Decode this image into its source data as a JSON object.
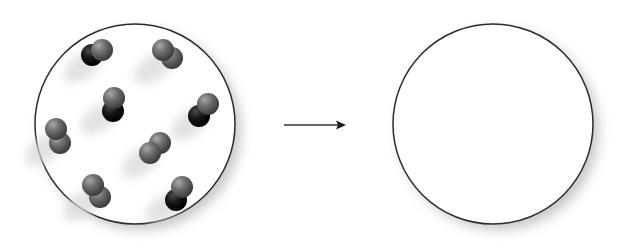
{
  "diagram": {
    "left_container": {
      "label": "container-with-molecules",
      "cx": 135,
      "cy": 124,
      "r": 100,
      "molecule_count": 8,
      "molecules": [
        {
          "type": "heteronuclear",
          "x1": 92,
          "y1": 55,
          "x2": 102,
          "y2": 50,
          "dark_first": true
        },
        {
          "type": "homonuclear",
          "x1": 163,
          "y1": 50,
          "x2": 172,
          "y2": 58,
          "dark_first": false
        },
        {
          "type": "heteronuclear",
          "x1": 113,
          "y1": 111,
          "x2": 114,
          "y2": 98,
          "dark_first": true
        },
        {
          "type": "heteronuclear",
          "x1": 199,
          "y1": 116,
          "x2": 208,
          "y2": 104,
          "dark_first": true
        },
        {
          "type": "homonuclear",
          "x1": 56,
          "y1": 129,
          "x2": 60,
          "y2": 143,
          "dark_first": false
        },
        {
          "type": "homonuclear",
          "x1": 150,
          "y1": 153,
          "x2": 160,
          "y2": 143,
          "dark_first": false
        },
        {
          "type": "homonuclear",
          "x1": 93,
          "y1": 185,
          "x2": 100,
          "y2": 197,
          "dark_first": false
        },
        {
          "type": "heteronuclear",
          "x1": 176,
          "y1": 200,
          "x2": 182,
          "y2": 187,
          "dark_first": true
        }
      ]
    },
    "arrow": {
      "x1": 284,
      "y1": 125,
      "x2": 345,
      "y2": 125,
      "direction": "right"
    },
    "right_container": {
      "label": "empty-container",
      "cx": 493,
      "cy": 124,
      "r": 100,
      "molecule_count": 0
    },
    "colors": {
      "outline": "#2a2a2a",
      "atom_light": "#6e6e6e",
      "atom_dark": "#151515",
      "shadow": "#bdbdbd",
      "background": "#ffffff"
    }
  }
}
